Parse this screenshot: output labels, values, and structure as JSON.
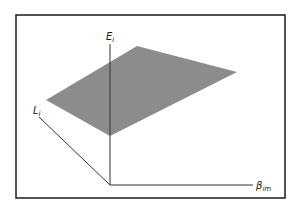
{
  "figure": {
    "frame": {
      "x": 16,
      "y": 15,
      "width": 269,
      "height": 183,
      "stroke": "#1a1a1a"
    },
    "plane": {
      "fill": "#8c8c8c",
      "points": "137,46 237,72 110,136 46,100"
    },
    "axes": {
      "vertical": {
        "name": "E",
        "subscript": "i",
        "x1": 110,
        "y1": 44,
        "x2": 110,
        "y2": 185,
        "label_x": 106,
        "label_y": 40
      },
      "depth": {
        "name": "L",
        "subscript": "i",
        "x1": 39,
        "y1": 117,
        "x2": 110,
        "y2": 185,
        "label_x": 33,
        "label_y": 114
      },
      "horizontal": {
        "name": "β",
        "subscript": "im",
        "x1": 110,
        "y1": 185,
        "x2": 253,
        "y2": 185,
        "label_x": 257,
        "label_y": 189
      },
      "stroke": "#333333"
    }
  }
}
